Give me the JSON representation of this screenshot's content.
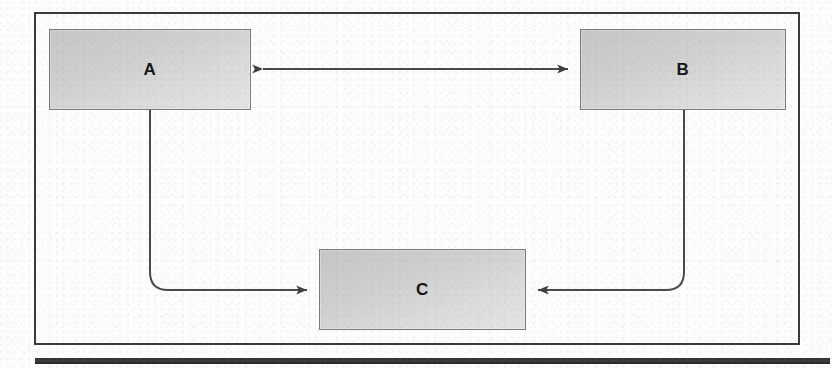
{
  "diagram": {
    "frame": {
      "name": "outer-border",
      "stroke": "#3a3a3a"
    },
    "nodes": [
      {
        "id": "A",
        "label": "A",
        "x": 49,
        "y": 29,
        "width": 202,
        "height": 81
      },
      {
        "id": "B",
        "label": "B",
        "x": 580,
        "y": 29,
        "width": 206,
        "height": 81
      },
      {
        "id": "C",
        "label": "C",
        "x": 319,
        "y": 249,
        "width": 207,
        "height": 81
      }
    ],
    "edges": [
      {
        "id": "a-b",
        "from": "A",
        "to": "B",
        "arrows": "both",
        "routing": "straight-horizontal"
      },
      {
        "id": "a-c",
        "from": "A",
        "to": "C",
        "arrows": "both",
        "routing": "orthogonal-rounded-left"
      },
      {
        "id": "b-c",
        "from": "B",
        "to": "C",
        "arrows": "both",
        "routing": "orthogonal-rounded-right"
      }
    ],
    "colors": {
      "node_fill_top": "#c6c6c6",
      "node_fill_bottom": "#e4e4e4",
      "node_stroke": "#7b7b7b",
      "edge_stroke": "#4a4a4a",
      "frame_stroke": "#3a3a3a",
      "label_color": "#151515",
      "rule_color": "#2b2b2b",
      "page_background": "#fdfdfd"
    },
    "bottom_rule": {
      "name": "bottom-rule",
      "x": 35,
      "y": 358,
      "width": 795,
      "height": 6
    }
  }
}
